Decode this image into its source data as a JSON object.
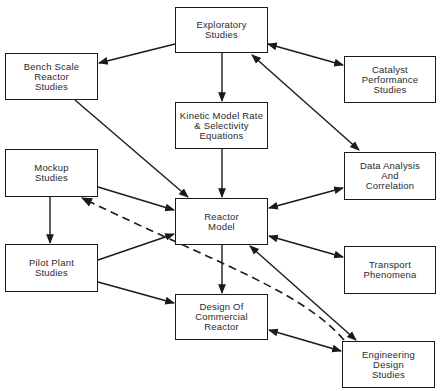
{
  "diagram": {
    "type": "flowchart",
    "colors": {
      "line": "#1a1a1a",
      "text": "#2a2a2a",
      "background": "#ffffff"
    },
    "nodes": [
      {
        "id": "exploratory",
        "label": "Exploratory\nStudies",
        "x": 175,
        "y": 7,
        "w": 93,
        "h": 46
      },
      {
        "id": "bench",
        "label": "Bench Scale\nReactor\nStudies",
        "x": 5,
        "y": 53,
        "w": 93,
        "h": 47
      },
      {
        "id": "catalyst",
        "label": "Catalyst\nPerformance\nStudies",
        "x": 344,
        "y": 56,
        "w": 92,
        "h": 47
      },
      {
        "id": "kinetic",
        "label": "Kinetic Model Rate\n& Selectivity\nEquations",
        "x": 175,
        "y": 102,
        "w": 93,
        "h": 47
      },
      {
        "id": "mockup",
        "label": "Mockup\nStudies",
        "x": 5,
        "y": 149,
        "w": 93,
        "h": 48
      },
      {
        "id": "data",
        "label": "Data Analysis\nAnd\nCorrelation",
        "x": 344,
        "y": 152,
        "w": 92,
        "h": 48
      },
      {
        "id": "reactor",
        "label": "Reactor\nModel",
        "x": 175,
        "y": 198,
        "w": 93,
        "h": 47
      },
      {
        "id": "pilot",
        "label": "Pilot Plant\nStudies",
        "x": 5,
        "y": 244,
        "w": 93,
        "h": 48
      },
      {
        "id": "transport",
        "label": "Transport\nPhenomena",
        "x": 344,
        "y": 246,
        "w": 92,
        "h": 48
      },
      {
        "id": "design",
        "label": "Design Of\nCommercial\nReactor",
        "x": 175,
        "y": 294,
        "w": 93,
        "h": 46
      },
      {
        "id": "engineering",
        "label": "Engineering\nDesign\nStudies",
        "x": 342,
        "y": 341,
        "w": 93,
        "h": 47
      }
    ],
    "edges": [
      {
        "from": "exploratory",
        "to": "bench",
        "style": "solid",
        "direction": "forward",
        "points": [
          [
            175,
            44
          ],
          [
            99,
            63
          ]
        ]
      },
      {
        "from": "exploratory",
        "to": "kinetic",
        "style": "solid",
        "direction": "forward",
        "points": [
          [
            222,
            53
          ],
          [
            222,
            101
          ]
        ]
      },
      {
        "from": "exploratory",
        "to": "catalyst",
        "style": "solid",
        "direction": "both",
        "points": [
          [
            268,
            44
          ],
          [
            343,
            65
          ]
        ]
      },
      {
        "from": "data",
        "to": "exploratory",
        "style": "solid",
        "direction": "both",
        "points": [
          [
            359,
            150
          ],
          [
            252,
            55
          ]
        ]
      },
      {
        "from": "bench",
        "to": "reactor",
        "style": "solid",
        "direction": "forward",
        "points": [
          [
            75,
            100
          ],
          [
            188,
            197
          ]
        ]
      },
      {
        "from": "kinetic",
        "to": "reactor",
        "style": "solid",
        "direction": "forward",
        "points": [
          [
            222,
            149
          ],
          [
            222,
            197
          ]
        ]
      },
      {
        "from": "mockup",
        "to": "reactor",
        "style": "solid",
        "direction": "forward",
        "points": [
          [
            98,
            187
          ],
          [
            174,
            210
          ]
        ]
      },
      {
        "from": "mockup",
        "to": "pilot",
        "style": "solid",
        "direction": "forward",
        "points": [
          [
            50,
            197
          ],
          [
            50,
            243
          ]
        ]
      },
      {
        "from": "pilot",
        "to": "reactor",
        "style": "solid",
        "direction": "forward",
        "points": [
          [
            98,
            260
          ],
          [
            174,
            234
          ]
        ]
      },
      {
        "from": "reactor",
        "to": "data",
        "style": "solid",
        "direction": "both",
        "points": [
          [
            269,
            208
          ],
          [
            343,
            188
          ]
        ]
      },
      {
        "from": "reactor",
        "to": "transport",
        "style": "solid",
        "direction": "both",
        "points": [
          [
            269,
            236
          ],
          [
            343,
            257
          ]
        ]
      },
      {
        "from": "reactor",
        "to": "design",
        "style": "solid",
        "direction": "forward",
        "points": [
          [
            222,
            245
          ],
          [
            222,
            293
          ]
        ]
      },
      {
        "from": "pilot",
        "to": "design",
        "style": "solid",
        "direction": "forward",
        "points": [
          [
            98,
            282
          ],
          [
            174,
            303
          ]
        ]
      },
      {
        "from": "engineering",
        "to": "reactor",
        "style": "solid",
        "direction": "both",
        "points": [
          [
            356,
            340
          ],
          [
            250,
            246
          ]
        ]
      },
      {
        "from": "design",
        "to": "engineering",
        "style": "solid",
        "direction": "both",
        "points": [
          [
            269,
            330
          ],
          [
            341,
            351
          ]
        ]
      },
      {
        "from": "engineering",
        "to": "mockup",
        "style": "dashed",
        "direction": "forward",
        "points": [
          [
            344,
            340
          ],
          [
            300,
            290
          ],
          [
            220,
            265
          ],
          [
            82,
            198
          ]
        ]
      }
    ]
  }
}
